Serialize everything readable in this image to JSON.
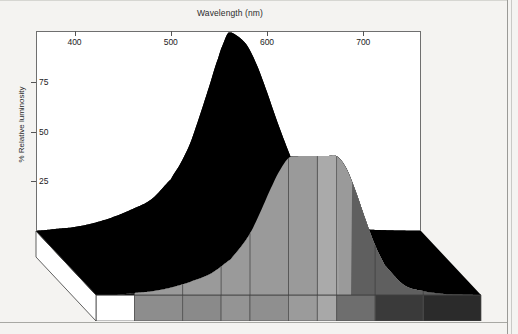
{
  "figure": {
    "title": "Wavelength (nm)",
    "ylabel": "% Relative luminosity"
  },
  "chart_data": {
    "type": "area",
    "title": "Wavelength (nm)",
    "xlabel": "Wavelength (nm)",
    "ylabel": "% Relative luminosity",
    "xlim": [
      360,
      760
    ],
    "ylim": [
      0,
      105
    ],
    "xticks": [
      400,
      500,
      600,
      700
    ],
    "xticklabels": [
      "400",
      "500",
      "600",
      "700"
    ],
    "yticks": [
      25,
      50,
      75
    ],
    "yticklabels": [
      "25",
      "50",
      "75"
    ],
    "grid": false,
    "legend": null,
    "projection": "3d-ribbon",
    "series": [
      {
        "name": "Relative luminosity (back edge)",
        "fill_color": "#000000",
        "x": [
          360,
          380,
          400,
          420,
          440,
          460,
          480,
          500,
          510,
          520,
          530,
          540,
          550,
          555,
          560,
          570,
          580,
          590,
          600,
          610,
          620,
          630,
          640,
          650,
          660,
          680,
          700,
          720,
          740,
          760
        ],
        "values": [
          0,
          1,
          2,
          4,
          7,
          11,
          16,
          26,
          34,
          44,
          58,
          73,
          88,
          95,
          100,
          98,
          93,
          83,
          70,
          56,
          43,
          31,
          21,
          13,
          8,
          3,
          1,
          0.4,
          0.1,
          0
        ]
      },
      {
        "name": "Relative luminosity (front edge)",
        "fill_color": "#9a9a9a",
        "x": [
          360,
          380,
          400,
          420,
          440,
          460,
          480,
          500,
          510,
          520,
          530,
          540,
          550,
          560,
          570,
          580,
          590,
          600,
          610,
          620,
          630,
          640,
          650,
          660,
          680,
          700,
          720,
          740,
          760
        ],
        "values": [
          0,
          0,
          1,
          2,
          4,
          7,
          11,
          18,
          24,
          31,
          41,
          52,
          62,
          69,
          70,
          70,
          70,
          70,
          70,
          64,
          52,
          38,
          25,
          15,
          5,
          2,
          0.6,
          0.2,
          0
        ]
      }
    ],
    "base_strip": {
      "description": "visible spectrum swatch under the curve, grayscale",
      "segments": [
        {
          "label": "below-violet",
          "start_nm": 360,
          "end_nm": 400,
          "color": "#ffffff"
        },
        {
          "label": "violet",
          "start_nm": 400,
          "end_nm": 450,
          "color": "#8d8d8d"
        },
        {
          "label": "blue",
          "start_nm": 450,
          "end_nm": 490,
          "color": "#8a8a8a"
        },
        {
          "label": "cyan",
          "start_nm": 490,
          "end_nm": 520,
          "color": "#949494"
        },
        {
          "label": "green",
          "start_nm": 520,
          "end_nm": 560,
          "color": "#8f8f8f"
        },
        {
          "label": "yellow-green",
          "start_nm": 560,
          "end_nm": 590,
          "color": "#9b9b9b"
        },
        {
          "label": "yellow",
          "start_nm": 590,
          "end_nm": 610,
          "color": "#a8a8a8"
        },
        {
          "label": "orange",
          "start_nm": 610,
          "end_nm": 650,
          "color": "#6e6e6e"
        },
        {
          "label": "red",
          "start_nm": 650,
          "end_nm": 700,
          "color": "#3a3a3a"
        },
        {
          "label": "deep-red",
          "start_nm": 700,
          "end_nm": 760,
          "color": "#2b2b2b"
        }
      ]
    }
  }
}
